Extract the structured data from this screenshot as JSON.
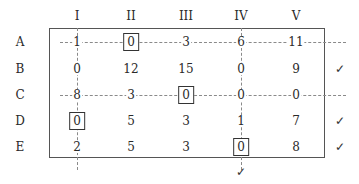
{
  "table": {
    "columns": [
      "I",
      "II",
      "III",
      "IV",
      "V"
    ],
    "rows": [
      {
        "label": "A",
        "values": [
          "1",
          "0",
          "3",
          "6",
          "11"
        ],
        "boxed": [
          false,
          true,
          false,
          false,
          false
        ],
        "checked": false,
        "covered": true
      },
      {
        "label": "B",
        "values": [
          "0",
          "12",
          "15",
          "0",
          "9"
        ],
        "boxed": [
          false,
          false,
          false,
          false,
          false
        ],
        "checked": true,
        "covered": false
      },
      {
        "label": "C",
        "values": [
          "8",
          "3",
          "0",
          "0",
          "0"
        ],
        "boxed": [
          false,
          false,
          true,
          false,
          false
        ],
        "checked": false,
        "covered": true
      },
      {
        "label": "D",
        "values": [
          "0",
          "5",
          "3",
          "1",
          "7"
        ],
        "boxed": [
          true,
          false,
          false,
          false,
          false
        ],
        "checked": true,
        "covered": false
      },
      {
        "label": "E",
        "values": [
          "2",
          "5",
          "3",
          "0",
          "8"
        ],
        "boxed": [
          false,
          false,
          false,
          true,
          false
        ],
        "checked": true,
        "covered": false
      }
    ],
    "checked_columns": [
      "IV"
    ],
    "covered_columns": [
      "I",
      "IV"
    ],
    "check_mark": "✓"
  }
}
